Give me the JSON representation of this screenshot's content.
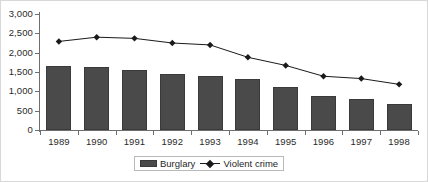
{
  "chart_data": {
    "type": "bar",
    "title": "",
    "subtitle": "",
    "xlabel": "",
    "ylabel": "",
    "categories": [
      "1989",
      "1990",
      "1991",
      "1992",
      "1993",
      "1994",
      "1995",
      "1996",
      "1997",
      "1998"
    ],
    "ylim": [
      0,
      3000
    ],
    "y_ticks": [
      0,
      500,
      1000,
      1500,
      2000,
      2500,
      3000
    ],
    "y_tick_labels": [
      "0",
      "500",
      "1,000",
      "1,500",
      "2,000",
      "2,500",
      "3,000"
    ],
    "grid": false,
    "legend_position": "bottom-center",
    "series": [
      {
        "name": "Burglary",
        "type": "bar",
        "color": "#4a4a4a",
        "values": [
          1650,
          1620,
          1560,
          1440,
          1400,
          1310,
          1100,
          880,
          790,
          670
        ]
      },
      {
        "name": "Violent crime",
        "type": "line",
        "color": "#1a1a1a",
        "marker": "diamond",
        "values": [
          2290,
          2400,
          2370,
          2250,
          2200,
          1880,
          1670,
          1390,
          1330,
          1180
        ]
      }
    ]
  },
  "legend": {
    "items": [
      {
        "label": "Burglary",
        "marker": "bar-swatch"
      },
      {
        "label": "Violent crime",
        "marker": "line-diamond"
      }
    ]
  },
  "colors": {
    "bar_fill": "#4a4a4a",
    "bar_stroke": "#3a3a3a",
    "line": "#1a1a1a",
    "axis": "#6f6f6f",
    "text": "#2b2b2b",
    "frame": "#d8d8d8",
    "background": "#ffffff"
  }
}
